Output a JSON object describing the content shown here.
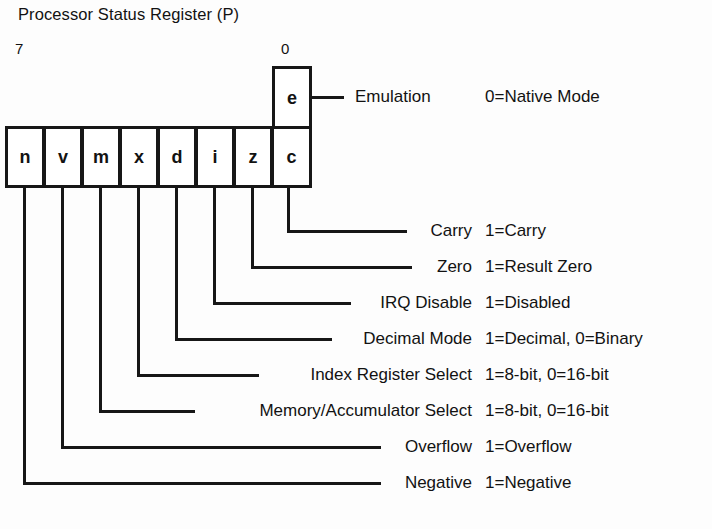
{
  "title": "Processor Status Register (P)",
  "bit_index": {
    "high": "7",
    "low": "0"
  },
  "register": {
    "bits": [
      {
        "label": "n",
        "bit": 7
      },
      {
        "label": "v",
        "bit": 6
      },
      {
        "label": "m",
        "bit": 5
      },
      {
        "label": "x",
        "bit": 4
      },
      {
        "label": "d",
        "bit": 3
      },
      {
        "label": "i",
        "bit": 2
      },
      {
        "label": "z",
        "bit": 1
      },
      {
        "label": "c",
        "bit": 0
      }
    ],
    "emulation_bit": {
      "label": "e"
    }
  },
  "emulation": {
    "name": "Emulation",
    "description": "0=Native Mode"
  },
  "flags": [
    {
      "bit_label": "c",
      "name": "Carry",
      "description": "1=Carry"
    },
    {
      "bit_label": "z",
      "name": "Zero",
      "description": "1=Result Zero"
    },
    {
      "bit_label": "i",
      "name": "IRQ Disable",
      "description": "1=Disabled"
    },
    {
      "bit_label": "d",
      "name": "Decimal Mode",
      "description": "1=Decimal, 0=Binary"
    },
    {
      "bit_label": "x",
      "name": "Index Register Select",
      "description": "1=8-bit, 0=16-bit"
    },
    {
      "bit_label": "m",
      "name": "Memory/Accumulator Select",
      "description": "1=8-bit, 0=16-bit"
    },
    {
      "bit_label": "v",
      "name": "Overflow",
      "description": "1=Overflow"
    },
    {
      "bit_label": "n",
      "name": "Negative",
      "description": "1=Negative"
    }
  ],
  "colors": {
    "ink": "#171717",
    "paper": "#fdfdfd"
  }
}
